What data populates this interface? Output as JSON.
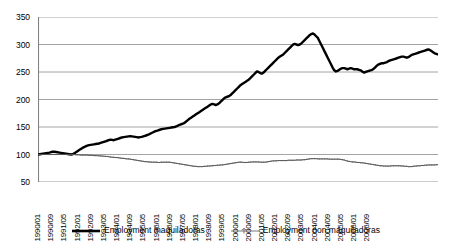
{
  "chart_data": {
    "type": "line",
    "title": "",
    "subtitle": "",
    "xlabel": "",
    "ylabel": "",
    "ylim": [
      50,
      350
    ],
    "ytick_step": 50,
    "ytick_labels": [
      "350",
      "300",
      "250",
      "200",
      "150",
      "100",
      "50"
    ],
    "ytick_values": [
      350,
      300,
      250,
      200,
      150,
      100,
      50
    ],
    "grid": "horizontal",
    "legend_position": "bottom-center",
    "x_label_interval_months": 8,
    "xtick_labels": [
      "1990/01",
      "1990/09",
      "1991/05",
      "1992/01",
      "1992/09",
      "1993/05",
      "1994/01",
      "1994/09",
      "1995/05",
      "1996/01",
      "1996/09",
      "1997/05",
      "1998/01",
      "1998/09",
      "1999/05",
      "2000/01",
      "2000/09",
      "2001/05",
      "2002/01",
      "2002/09",
      "2003/05",
      "2004/01",
      "2004/09",
      "2005/05",
      "2006/01",
      "2006/09"
    ],
    "x_start": "1990/01",
    "x_end": "2006/12",
    "n_points": 204,
    "series": [
      {
        "name": "Employment maquiladoras",
        "color": "#000000",
        "style": "thick-solid",
        "marker": "none",
        "values": [
          100,
          100.5,
          101,
          101.5,
          102,
          102.5,
          103,
          103.5,
          104.5,
          105,
          105,
          104.5,
          104,
          103.5,
          103,
          102.5,
          102,
          101.5,
          101,
          100.5,
          100,
          100.5,
          102,
          104,
          106,
          108,
          110,
          112,
          113.5,
          115,
          116,
          117,
          117.5,
          118,
          118.5,
          119,
          119.5,
          120,
          121,
          122,
          123,
          124,
          125,
          126,
          127,
          126.5,
          126,
          127,
          128,
          129,
          130,
          131,
          131.5,
          132,
          132.5,
          133,
          133.5,
          133,
          132.5,
          132,
          131.5,
          131,
          131.5,
          132,
          133,
          134,
          135,
          136,
          137.5,
          139,
          140.5,
          142,
          143,
          144,
          145,
          146,
          146.5,
          147,
          147.5,
          148,
          148.5,
          149,
          149.5,
          150,
          151,
          152.5,
          154,
          155,
          156,
          157.5,
          160,
          162.5,
          165,
          167,
          169,
          171,
          173,
          175,
          177,
          179,
          181,
          183,
          185,
          187,
          189,
          191,
          192,
          191,
          190,
          191,
          193,
          196,
          199,
          202,
          204,
          205,
          206,
          208,
          211,
          214,
          217,
          220,
          223,
          226,
          228,
          230,
          232,
          234,
          236,
          239,
          242,
          245,
          248,
          251,
          250,
          248,
          247,
          249,
          252,
          255,
          258,
          261,
          264,
          267,
          270,
          273,
          276,
          278,
          280,
          282,
          285,
          288,
          291,
          294,
          297,
          300,
          301,
          300,
          299,
          300,
          302,
          305,
          308,
          311,
          314,
          317,
          319,
          320,
          318,
          315,
          312,
          306,
          300,
          294,
          288,
          282,
          276,
          270,
          264,
          258,
          253,
          251,
          252,
          254,
          256,
          257,
          257,
          256,
          255,
          256,
          257,
          256,
          255,
          255,
          255,
          254,
          253,
          251,
          249,
          250,
          251,
          252,
          253,
          254,
          256,
          259,
          262,
          264,
          265,
          266,
          266,
          267,
          268,
          270,
          271,
          272,
          273,
          274,
          275,
          276,
          277,
          278,
          278,
          277,
          276,
          277,
          279,
          281,
          282,
          283,
          284,
          285,
          286,
          287,
          288,
          289,
          290,
          291,
          290,
          288,
          286,
          284,
          283,
          282
        ]
      },
      {
        "name": "Employment non maquiladoras",
        "color": "#555555",
        "style": "thin-solid",
        "marker": "dot",
        "values": [
          100,
          100,
          100,
          100,
          100,
          100,
          100,
          100,
          100,
          100,
          100,
          100,
          100,
          100,
          100,
          100,
          100,
          100,
          100,
          100,
          100,
          100,
          100,
          99.5,
          99.5,
          99.5,
          99,
          99,
          99,
          99,
          99,
          98.5,
          98.5,
          98.5,
          98,
          98,
          98,
          97.5,
          97.5,
          97,
          97,
          96.5,
          96.5,
          96,
          95.5,
          95,
          95,
          94.5,
          94.5,
          94,
          93.5,
          93,
          93,
          92.5,
          92,
          92,
          91.5,
          91,
          90.5,
          90,
          89.5,
          89,
          88.5,
          88,
          87.5,
          87,
          87,
          86.5,
          86.5,
          86,
          86,
          86,
          86,
          85.5,
          85.5,
          86,
          86,
          86,
          86,
          86,
          86,
          85.5,
          85,
          84.5,
          84,
          83.5,
          83,
          82.5,
          82,
          81.5,
          81,
          80.5,
          80,
          79.5,
          79,
          78.5,
          78.5,
          78,
          78,
          78,
          78,
          78.5,
          78.5,
          79,
          79,
          79.5,
          79.5,
          80,
          80,
          80.5,
          80.5,
          81,
          81,
          81.5,
          82,
          82.5,
          83,
          83.5,
          84,
          84.5,
          85,
          85.5,
          86,
          86,
          86,
          85.5,
          85.5,
          85.5,
          86,
          86,
          86.5,
          86.5,
          86.5,
          86.5,
          86.5,
          86,
          86,
          86,
          86,
          86.5,
          87,
          87.5,
          88,
          88.5,
          88.5,
          88.5,
          89,
          89,
          89,
          89,
          89,
          89,
          89.5,
          89.5,
          89.5,
          89.5,
          89.5,
          90,
          90,
          90,
          90,
          90.5,
          90.5,
          91,
          91.5,
          92,
          92.5,
          92.5,
          92.5,
          92.5,
          92,
          92,
          92,
          92,
          92,
          92,
          92,
          91.5,
          91.5,
          91.5,
          91.5,
          91.5,
          91.5,
          91.5,
          91,
          90.5,
          90,
          89,
          88,
          87.5,
          87,
          86.5,
          86.5,
          86,
          85.5,
          85.5,
          85,
          85,
          84.5,
          84,
          83.5,
          83,
          82.5,
          82,
          81.5,
          81,
          80.5,
          80,
          79.5,
          79.5,
          79,
          79,
          79,
          79,
          79,
          79.5,
          79.5,
          79.5,
          79.5,
          79.5,
          79.5,
          79,
          79,
          78.5,
          78.5,
          78,
          78,
          78,
          78.5,
          79,
          79,
          79.5,
          79.5,
          80,
          80,
          80.5,
          80.5,
          81,
          81,
          81,
          81,
          81,
          81.5,
          81.5
        ]
      }
    ]
  },
  "legend": {
    "entries": [
      {
        "label": "Employment maquiladoras",
        "swatch": "thick-line-swatch"
      },
      {
        "label": "Employment non maquiladoras",
        "swatch": "thin-line-marker-swatch"
      }
    ]
  },
  "colors": {
    "series_primary": "#000000",
    "series_secondary": "#555555",
    "gridline": "#9a9a9a",
    "axis": "#808080",
    "background": "#ffffff"
  }
}
